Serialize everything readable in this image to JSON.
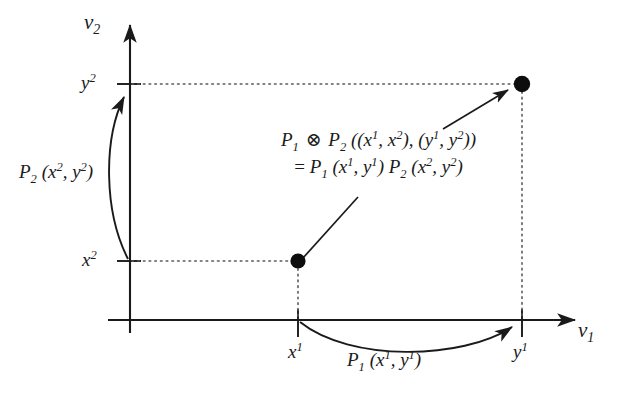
{
  "figure": {
    "type": "mathematical-diagram",
    "background_color": "#ffffff",
    "ink_color": "#1a1a1a"
  },
  "axes": {
    "horizontal": {
      "name_html": "ν<sub>1</sub>",
      "name_plain": "ν1",
      "ticks": [
        {
          "id": "x1",
          "html": "x<sup>1</sup>",
          "plain": "x1"
        },
        {
          "id": "y1",
          "html": "y<sup>1</sup>",
          "plain": "y1"
        }
      ]
    },
    "vertical": {
      "name_html": "ν<sub>2</sub>",
      "name_plain": "ν2",
      "ticks": [
        {
          "id": "x2",
          "html": "x<sup>2</sup>",
          "plain": "x2"
        },
        {
          "id": "y2",
          "html": "y<sup>2</sup>",
          "plain": "y2"
        }
      ]
    }
  },
  "annotations": {
    "vertical_arc_label_html": "P<sub>2</sub> (x<sup>2</sup>, y<sup>2</sup>)",
    "vertical_arc_label_plain": "P2 (x2, y2)",
    "horizontal_arc_label_html": "P<sub>1</sub> (x<sup>1</sup>, y<sup>1</sup>)",
    "horizontal_arc_label_plain": "P1 (x1, y1)",
    "formula_line1_html": "P<sub>1</sub> <span class=\"op\">⊗</span> P<sub>2</sub> ((x<sup>1</sup>, x<sup>2</sup>), (y<sup>1</sup>, y<sup>2</sup>))",
    "formula_line1_plain": "P1 ⊗ P2 ((x1, x2), (y1, y2))",
    "formula_line2_html": "<span class=\"eq\">=</span> P<sub>1</sub> (x<sup>1</sup>, y<sup>1</sup>) P<sub>2</sub> (x<sup>2</sup>, y<sup>2</sup>)",
    "formula_line2_plain": "= P1 (x1, y1) P2 (x2, y2)"
  },
  "points": [
    {
      "id": "lower-point",
      "label": "(x1, x2)",
      "x_tick": "x1",
      "y_tick": "x2"
    },
    {
      "id": "upper-point",
      "label": "(y1, y2)",
      "x_tick": "y1",
      "y_tick": "y2"
    }
  ]
}
